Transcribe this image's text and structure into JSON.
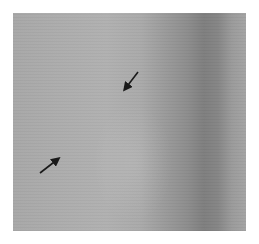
{
  "image": {
    "description": "Grayscale micrograph with two black arrows pointing toward a textured region",
    "arrows": [
      {
        "name": "arrow-upper",
        "tail": [
          138,
          72
        ],
        "head": [
          123,
          92
        ]
      },
      {
        "name": "arrow-lower",
        "tail": [
          40,
          173
        ],
        "head": [
          61,
          157
        ]
      }
    ],
    "colors": {
      "background": "#ffffff",
      "arrow": "#1a1a1a"
    }
  }
}
